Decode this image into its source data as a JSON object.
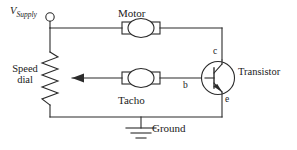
{
  "diagram": {
    "stroke_color": "#2b2b2b",
    "background_color": "#ffffff",
    "labels": {
      "supply": "V",
      "supply_sub": "Supply",
      "motor": "Motor",
      "tacho": "Tacho",
      "transistor": "Transistor",
      "ground": "Ground",
      "speed_dial_line1": "Speed",
      "speed_dial_line2": "dial",
      "terminal_base": "b",
      "terminal_collector": "c",
      "terminal_emitter": "e"
    }
  }
}
